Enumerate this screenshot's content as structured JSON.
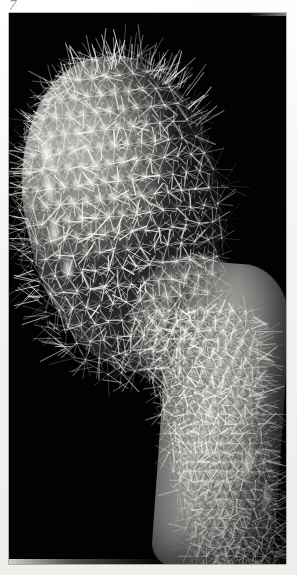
{
  "page": {
    "background_color": "#f4f3f0",
    "kind": "photographic-plate-on-paper"
  },
  "annotation": {
    "text": "7",
    "description": "faint handwritten mark in upper-left margin",
    "color": "#3a3a3a"
  },
  "plate": {
    "background_color": "#000000",
    "x": 9,
    "y": 13,
    "width": 277,
    "height": 551,
    "caption": ""
  },
  "subject": {
    "name": "spiny cactus specimen",
    "description": "Club-shaped spiny cactus head with tubercles in spiral ranks, tapering into a narrower spiny stem that descends toward the lower-right and is cropped by the frame edge.",
    "palette": {
      "background": "#000000",
      "body_mid": "#8a8a88",
      "body_light": "#b9b9b7",
      "body_shadow": "#262626",
      "spine_color": "#e9e9e5",
      "highlight": "#fffffc"
    },
    "parts": [
      {
        "id": "head",
        "label": "cactus head"
      },
      {
        "id": "neck",
        "label": "neck"
      },
      {
        "id": "stem",
        "label": "lower stem"
      }
    ]
  }
}
